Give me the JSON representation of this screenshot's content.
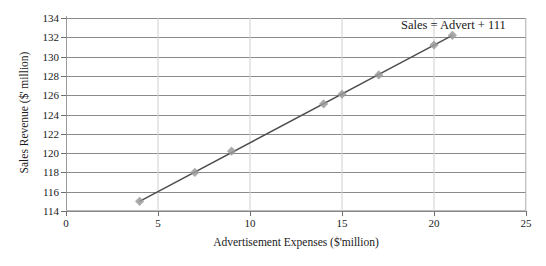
{
  "chart_data": {
    "type": "scatter",
    "title": "",
    "xlabel": "Advertisement Expenses ($'million)",
    "ylabel": "Sales Revenue ($' million)",
    "xlim": [
      0,
      25
    ],
    "ylim": [
      114,
      134
    ],
    "x_ticks": [
      "0",
      "5",
      "10",
      "15",
      "20",
      "25"
    ],
    "x_tick_values": [
      0,
      5,
      10,
      15,
      20,
      25
    ],
    "y_ticks": [
      "114",
      "116",
      "118",
      "120",
      "122",
      "124",
      "126",
      "128",
      "130",
      "132",
      "134"
    ],
    "y_tick_values": [
      114,
      116,
      118,
      120,
      122,
      124,
      126,
      128,
      130,
      132,
      134
    ],
    "grid": "horizontal",
    "legend": "none",
    "x": [
      4,
      7,
      9,
      14,
      15,
      17,
      20,
      21
    ],
    "y": [
      115.0,
      118.0,
      120.2,
      125.1,
      126.1,
      128.1,
      131.2,
      132.2
    ],
    "points": [
      {
        "x": 4,
        "y": 115.0
      },
      {
        "x": 7,
        "y": 118.0
      },
      {
        "x": 9,
        "y": 120.2
      },
      {
        "x": 14,
        "y": 125.1
      },
      {
        "x": 15,
        "y": 126.1
      },
      {
        "x": 17,
        "y": 128.1
      },
      {
        "x": 20,
        "y": 131.2
      },
      {
        "x": 21,
        "y": 132.2
      }
    ],
    "trendline": {
      "label": "Sales = Advert + 111",
      "slope": 1,
      "intercept": 111,
      "x_start": 4,
      "y_start": 115.0,
      "x_end": 21,
      "y_end": 132.2
    },
    "annotations": [
      {
        "text": "Sales = Advert + 111",
        "position": "top-right"
      }
    ],
    "colors": {
      "marker": "#9b9b9b",
      "line": "#4d4d4d",
      "gridline": "#8a8a8a",
      "axis": "#8a8a8a",
      "text": "#1a1a1a",
      "background": "#ffffff"
    }
  }
}
